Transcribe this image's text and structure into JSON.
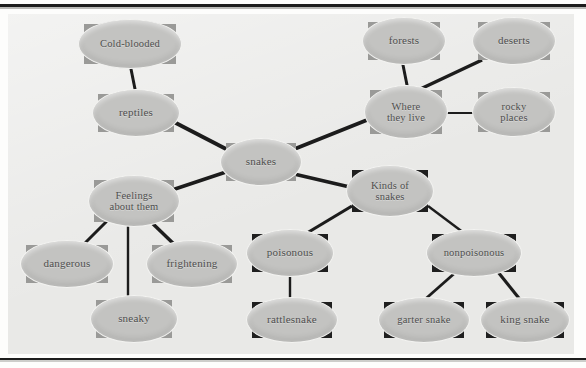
{
  "diagram": {
    "type": "mind-map",
    "background_color": "#e9e9e7",
    "node_fill_color": "#c3c3c1",
    "node_border_color": "#f3f3f1",
    "shadow_color_light": "#9a9a98",
    "shadow_color_dark": "#1f1f1f",
    "edge_color": "#1c1c1c",
    "center": "snakes",
    "nodes": [
      {
        "id": "cold-blooded",
        "label": "Cold-blooded",
        "x": 84,
        "y": 24,
        "w": 92,
        "h": 40,
        "shadow": "mid"
      },
      {
        "id": "forests",
        "label": "forests",
        "x": 368,
        "y": 22,
        "w": 72,
        "h": 38,
        "shadow": "mid"
      },
      {
        "id": "deserts",
        "label": "deserts",
        "x": 478,
        "y": 22,
        "w": 72,
        "h": 38,
        "shadow": "mid"
      },
      {
        "id": "reptiles",
        "label": "reptiles",
        "x": 98,
        "y": 94,
        "w": 76,
        "h": 38,
        "shadow": "mid"
      },
      {
        "id": "where-live",
        "label": "Where\nthey live",
        "x": 370,
        "y": 90,
        "w": 72,
        "h": 44,
        "shadow": "mid"
      },
      {
        "id": "rocky-places",
        "label": "rocky\nplaces",
        "x": 478,
        "y": 92,
        "w": 72,
        "h": 40,
        "shadow": "mid"
      },
      {
        "id": "snakes",
        "label": "snakes",
        "x": 226,
        "y": 143,
        "w": 70,
        "h": 38,
        "shadow": "mid"
      },
      {
        "id": "feelings",
        "label": "Feelings\nabout them",
        "x": 94,
        "y": 180,
        "w": 80,
        "h": 42,
        "shadow": "mid"
      },
      {
        "id": "kinds",
        "label": "Kinds of\nsnakes",
        "x": 352,
        "y": 170,
        "w": 76,
        "h": 42,
        "shadow": "dark"
      },
      {
        "id": "dangerous",
        "label": "dangerous",
        "x": 26,
        "y": 245,
        "w": 82,
        "h": 38,
        "shadow": "mid"
      },
      {
        "id": "frightening",
        "label": "frightening",
        "x": 152,
        "y": 245,
        "w": 80,
        "h": 38,
        "shadow": "mid"
      },
      {
        "id": "poisonous",
        "label": "poisonous",
        "x": 252,
        "y": 234,
        "w": 76,
        "h": 38,
        "shadow": "dark"
      },
      {
        "id": "nonpoisonous",
        "label": "nonpoisonous",
        "x": 432,
        "y": 234,
        "w": 84,
        "h": 38,
        "shadow": "dark"
      },
      {
        "id": "sneaky",
        "label": "sneaky",
        "x": 96,
        "y": 300,
        "w": 76,
        "h": 38,
        "shadow": "mid"
      },
      {
        "id": "rattlesnake",
        "label": "rattlesnake",
        "x": 252,
        "y": 302,
        "w": 80,
        "h": 36,
        "shadow": "dark"
      },
      {
        "id": "garter-snake",
        "label": "garter snake",
        "x": 384,
        "y": 302,
        "w": 80,
        "h": 36,
        "shadow": "dark"
      },
      {
        "id": "king-snake",
        "label": "king snake",
        "x": 486,
        "y": 302,
        "w": 78,
        "h": 36,
        "shadow": "dark"
      }
    ],
    "edges": [
      {
        "from": "cold-blooded",
        "to": "reptiles",
        "x1": 130,
        "y1": 64,
        "x2": 136,
        "y2": 94,
        "width": 3
      },
      {
        "from": "reptiles",
        "to": "snakes",
        "x1": 172,
        "y1": 121,
        "x2": 228,
        "y2": 150,
        "width": 4
      },
      {
        "from": "snakes",
        "to": "where-live",
        "x1": 292,
        "y1": 150,
        "x2": 372,
        "y2": 118,
        "width": 4
      },
      {
        "from": "forests",
        "to": "where-live",
        "x1": 402,
        "y1": 60,
        "x2": 408,
        "y2": 90,
        "width": 3
      },
      {
        "from": "deserts",
        "to": "where-live",
        "x1": 482,
        "y1": 60,
        "x2": 414,
        "y2": 92,
        "width": 3.5
      },
      {
        "from": "where-live",
        "to": "rocky-places",
        "x1": 443,
        "y1": 113,
        "x2": 478,
        "y2": 113,
        "width": 2.2
      },
      {
        "from": "snakes",
        "to": "feelings",
        "x1": 226,
        "y1": 172,
        "x2": 172,
        "y2": 190,
        "width": 3.5
      },
      {
        "from": "snakes",
        "to": "kinds",
        "x1": 294,
        "y1": 174,
        "x2": 354,
        "y2": 188,
        "width": 3.5
      },
      {
        "from": "feelings",
        "to": "dangerous",
        "x1": 108,
        "y1": 220,
        "x2": 80,
        "y2": 248,
        "width": 3
      },
      {
        "from": "feelings",
        "to": "frightening",
        "x1": 150,
        "y1": 221,
        "x2": 178,
        "y2": 248,
        "width": 3.5
      },
      {
        "from": "feelings",
        "to": "sneaky",
        "x1": 128,
        "y1": 222,
        "x2": 128,
        "y2": 300,
        "width": 2.4
      },
      {
        "from": "kinds",
        "to": "poisonous",
        "x1": 352,
        "y1": 206,
        "x2": 302,
        "y2": 236,
        "width": 3.2
      },
      {
        "from": "kinds",
        "to": "nonpoisonous",
        "x1": 428,
        "y1": 206,
        "x2": 468,
        "y2": 236,
        "width": 2.4
      },
      {
        "from": "poisonous",
        "to": "rattlesnake",
        "x1": 290,
        "y1": 272,
        "x2": 290,
        "y2": 302,
        "width": 2.4
      },
      {
        "from": "nonpoisonous",
        "to": "garter-snake",
        "x1": 456,
        "y1": 272,
        "x2": 422,
        "y2": 302,
        "width": 2.8
      },
      {
        "from": "nonpoisonous",
        "to": "king-snake",
        "x1": 498,
        "y1": 272,
        "x2": 522,
        "y2": 302,
        "width": 3.2
      }
    ]
  }
}
